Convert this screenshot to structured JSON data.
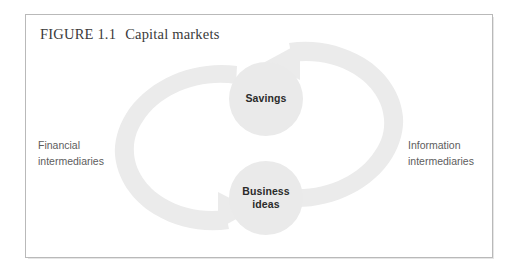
{
  "figure": {
    "number_label": "FIGURE 1.1",
    "title": "Capital markets",
    "frame_color": "#b9b9b9",
    "background_color": "#ffffff"
  },
  "diagram": {
    "type": "cycle",
    "node_fill_color": "#eaeaea",
    "arrow_fill_color": "#ebebeb",
    "nodes": [
      {
        "id": "savings",
        "label": "Savings",
        "label_lines": [
          "Savings"
        ],
        "position": "top-center"
      },
      {
        "id": "business-ideas",
        "label": "Business ideas",
        "label_lines": [
          "Business",
          "ideas"
        ],
        "position": "bottom-center"
      }
    ],
    "arrows": [
      {
        "id": "left-arrow",
        "from": "savings",
        "to": "business-ideas",
        "side": "left",
        "direction": "clockwise-down-right",
        "caption_id": "financial"
      },
      {
        "id": "right-arrow",
        "from": "business-ideas",
        "to": "savings",
        "side": "right",
        "direction": "clockwise-up-left",
        "caption_id": "information"
      }
    ],
    "captions": [
      {
        "id": "financial",
        "lines": [
          "Financial",
          "intermediaries"
        ],
        "side": "left"
      },
      {
        "id": "information",
        "lines": [
          "Information",
          "intermediaries"
        ],
        "side": "right"
      }
    ]
  }
}
